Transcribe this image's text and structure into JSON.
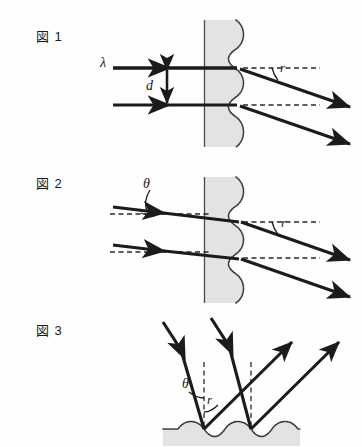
{
  "document": {
    "kind": "physics-diagram",
    "figure_count": 3
  },
  "figures": [
    {
      "id": "fig1",
      "label": "図 1",
      "labels": {
        "wavelength": "λ",
        "spacing": "d",
        "refraction_angle": "r"
      },
      "description_labels": [
        "λ",
        "d",
        "r"
      ]
    },
    {
      "id": "fig2",
      "label": "図 2",
      "labels": {
        "incidence_angle": "θ",
        "refraction_angle": "r"
      },
      "description_labels": [
        "θ",
        "r"
      ]
    },
    {
      "id": "fig3",
      "label": "図 3",
      "labels": {
        "incidence_angle": "θ",
        "reflection_angle": "r"
      },
      "description_labels": [
        "θ",
        "r"
      ]
    }
  ],
  "colors": {
    "ray": "#1b1b1b",
    "grating_fill": "#e3e3e3",
    "grating_edge": "#4a4a4a",
    "dashed": "#2a2a2a",
    "background": "#fefefe",
    "text": "#1a1a1a"
  }
}
